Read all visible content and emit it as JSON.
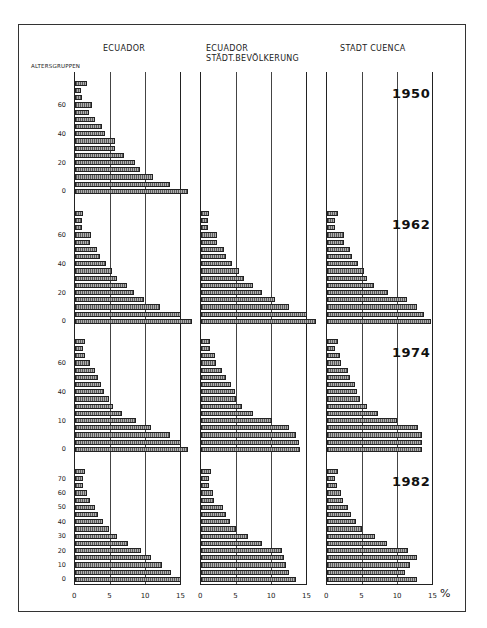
{
  "titles": {
    "col1": "ECUADOR",
    "col2_line1": "ECUADOR",
    "col2_line2": "STÄDT.BEVÖLKERUNG",
    "col3": "STADT CUENCA",
    "y_axis": "ALTERSGRUPPEN",
    "percent": "%"
  },
  "x_ticks": [
    "0",
    "5",
    "10",
    "15"
  ],
  "rows": [
    {
      "year": "1950",
      "y_labels": [
        {
          "v": "0",
          "i": 0
        },
        {
          "v": "20",
          "i": 4
        },
        {
          "v": "40",
          "i": 8
        },
        {
          "v": "60",
          "i": 12
        }
      ]
    },
    {
      "year": "1962",
      "y_labels": [
        {
          "v": "0",
          "i": 0
        },
        {
          "v": "20",
          "i": 4
        },
        {
          "v": "40",
          "i": 8
        },
        {
          "v": "60",
          "i": 12
        }
      ]
    },
    {
      "year": "1974",
      "y_labels": [
        {
          "v": "0",
          "i": 0
        },
        {
          "v": "10",
          "i": 4
        },
        {
          "v": "40",
          "i": 8
        },
        {
          "v": "60",
          "i": 12
        }
      ]
    },
    {
      "year": "1982",
      "y_labels": [
        {
          "v": "0",
          "i": 0
        },
        {
          "v": "10",
          "i": 2
        },
        {
          "v": "20",
          "i": 4
        },
        {
          "v": "30",
          "i": 6
        },
        {
          "v": "40",
          "i": 8
        },
        {
          "v": "50",
          "i": 10
        },
        {
          "v": "60",
          "i": 12
        },
        {
          "v": "70",
          "i": 14
        }
      ]
    }
  ],
  "chart_data": {
    "type": "bar",
    "xlabel": "%",
    "ylabel": "ALTERSGRUPPEN",
    "xlim": [
      0,
      15
    ],
    "x_ticks": [
      0,
      5,
      10,
      15
    ],
    "grid": true,
    "orientation": "horizontal",
    "age_groups": [
      "0-4",
      "5-9",
      "10-14",
      "15-19",
      "20-24",
      "25-29",
      "30-34",
      "35-39",
      "40-44",
      "45-49",
      "50-54",
      "55-59",
      "60-64",
      "65-69",
      "70-74",
      "75+"
    ],
    "panels": [
      {
        "column": "ECUADOR",
        "year": "1950",
        "values": [
          16.0,
          13.5,
          11.0,
          9.2,
          8.5,
          6.9,
          5.6,
          5.6,
          4.3,
          3.8,
          2.9,
          2.0,
          2.4,
          1.0,
          0.9,
          1.7
        ]
      },
      {
        "column": "ECUADOR STÄDT.BEVÖLKERUNG",
        "year": "1950",
        "values": []
      },
      {
        "column": "STADT CUENCA",
        "year": "1950",
        "values": []
      },
      {
        "column": "ECUADOR",
        "year": "1962",
        "values": [
          16.5,
          15.0,
          12.0,
          9.7,
          8.4,
          7.3,
          6.0,
          5.2,
          4.4,
          3.5,
          3.1,
          2.1,
          2.2,
          1.0,
          1.0,
          1.2
        ]
      },
      {
        "column": "ECUADOR STÄDT.BEVÖLKERUNG",
        "year": "1962",
        "values": [
          16.3,
          15.0,
          12.5,
          10.5,
          8.6,
          7.3,
          6.1,
          5.4,
          4.4,
          3.6,
          3.2,
          2.2,
          2.2,
          1.0,
          1.0,
          1.2
        ]
      },
      {
        "column": "STADT CUENCA",
        "year": "1962",
        "values": [
          14.7,
          13.7,
          12.8,
          11.3,
          8.7,
          6.6,
          5.7,
          5.2,
          4.4,
          3.6,
          3.3,
          2.4,
          2.4,
          1.2,
          1.2,
          1.5
        ]
      },
      {
        "column": "ECUADOR",
        "year": "1974",
        "values": [
          16.0,
          15.0,
          13.5,
          10.8,
          8.7,
          6.6,
          5.4,
          4.8,
          4.1,
          3.7,
          3.2,
          2.8,
          2.1,
          1.4,
          1.2,
          1.4
        ]
      },
      {
        "column": "ECUADOR STÄDT.BEVÖLKERUNG",
        "year": "1974",
        "values": [
          14.0,
          13.8,
          13.5,
          12.4,
          10.0,
          7.4,
          5.8,
          5.0,
          4.8,
          4.3,
          3.5,
          3.0,
          2.1,
          2.0,
          1.3,
          1.3
        ]
      },
      {
        "column": "STADT CUENCA",
        "year": "1974",
        "values": [
          13.5,
          13.4,
          13.5,
          12.9,
          9.9,
          7.2,
          5.6,
          4.6,
          4.3,
          4.0,
          3.3,
          3.0,
          2.0,
          1.8,
          1.1,
          1.6
        ]
      },
      {
        "column": "ECUADOR",
        "year": "1982",
        "values": [
          15.0,
          13.6,
          12.3,
          10.7,
          9.4,
          7.5,
          6.0,
          4.8,
          4.0,
          3.3,
          2.9,
          2.1,
          1.7,
          1.1,
          1.1,
          1.4
        ]
      },
      {
        "column": "ECUADOR STÄDT.BEVÖLKERUNG",
        "year": "1982",
        "values": [
          13.5,
          12.4,
          12.0,
          11.7,
          11.4,
          8.7,
          6.6,
          5.0,
          4.1,
          3.6,
          3.1,
          1.9,
          1.7,
          1.2,
          1.1,
          1.4
        ]
      },
      {
        "column": "STADT CUENCA",
        "year": "1982",
        "values": [
          12.8,
          11.1,
          11.8,
          12.8,
          11.5,
          8.5,
          6.8,
          5.0,
          4.1,
          3.4,
          3.0,
          2.2,
          2.0,
          1.4,
          1.2,
          1.6
        ]
      }
    ]
  }
}
